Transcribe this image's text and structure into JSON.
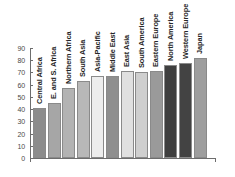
{
  "chart_data": {
    "type": "bar",
    "title": "",
    "subtitle": "",
    "xlabel": "",
    "ylabel": "",
    "ylim": [
      0,
      90
    ],
    "yticks": [
      0,
      10,
      20,
      30,
      40,
      50,
      60,
      70,
      80,
      90
    ],
    "grid": false,
    "legend": false,
    "categories": [
      "Central Africa",
      "E. and S. Africa",
      "Northern Africa",
      "South Asia",
      "Asia-Pacific",
      "Middle East",
      "East Asia",
      "South America",
      "Eastern Europe",
      "North America",
      "Western Europe",
      "Japan"
    ],
    "values": [
      41,
      45,
      57,
      63,
      67,
      67,
      71,
      70,
      71,
      76,
      78,
      82
    ],
    "bar_colors": [
      "#8c8c8c",
      "#a6a6a6",
      "#b3b3b3",
      "#b8b8b8",
      "#ededed",
      "#8f8f8f",
      "#e0e0e0",
      "#cfcfcf",
      "#9a9a9a",
      "#3f3f3f",
      "#434343",
      "#9e9e9e"
    ]
  },
  "colors": {
    "background": "#ffffff",
    "axis": "#6d6d6d",
    "tick_label": "#4a4a4a",
    "bar_label": "#262626",
    "bar_outline": "#8a8a8a"
  }
}
